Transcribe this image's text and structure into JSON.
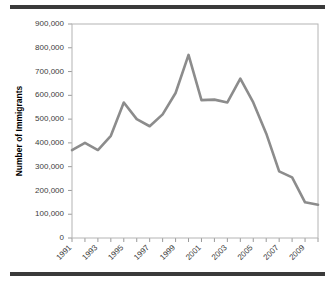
{
  "chart_data": {
    "type": "line",
    "title": "",
    "xlabel": "",
    "ylabel": "Number of Immigrants",
    "x": [
      1991,
      1992,
      1993,
      1994,
      1995,
      1996,
      1997,
      1998,
      1999,
      2000,
      2001,
      2002,
      2003,
      2004,
      2005,
      2006,
      2007,
      2008,
      2009,
      2010
    ],
    "values": [
      370000,
      400000,
      370000,
      430000,
      570000,
      500000,
      470000,
      520000,
      610000,
      770000,
      580000,
      582000,
      570000,
      670000,
      570000,
      440000,
      280000,
      255000,
      150000,
      140000
    ],
    "series": [
      {
        "name": "Number of Immigrants",
        "values": [
          370000,
          400000,
          370000,
          430000,
          570000,
          500000,
          470000,
          520000,
          610000,
          770000,
          580000,
          582000,
          570000,
          670000,
          570000,
          440000,
          280000,
          255000,
          150000,
          140000
        ]
      }
    ],
    "xlim": [
      1991,
      2010
    ],
    "ylim": [
      0,
      900000
    ],
    "ytick_values": [
      0,
      100000,
      200000,
      300000,
      400000,
      500000,
      600000,
      700000,
      800000,
      900000
    ],
    "ytick_labels": [
      "0",
      "100,000",
      "200,000",
      "300,000",
      "400,000",
      "500,000",
      "600,000",
      "700,000",
      "800,000",
      "900,000"
    ],
    "xtick_values": [
      1991,
      1993,
      1995,
      1997,
      1999,
      2001,
      2003,
      2005,
      2007,
      2009
    ],
    "xtick_labels": [
      "1991",
      "1993",
      "1995",
      "1997",
      "1999",
      "2001",
      "2003",
      "2005",
      "2007",
      "2009"
    ],
    "grid": false,
    "legend": false,
    "legend_position": "none",
    "line_color": "#8c8c8c",
    "axis_color": "#9a9a9a",
    "frame_color": "#b4b4b4",
    "tick_label_color": "#3d3d3d",
    "xtick_label_rotation": -45
  },
  "decorations": {
    "rule_color": "#3a3a3a",
    "top_rule_name": "top-divider",
    "bottom_rule_name": "bottom-divider"
  }
}
